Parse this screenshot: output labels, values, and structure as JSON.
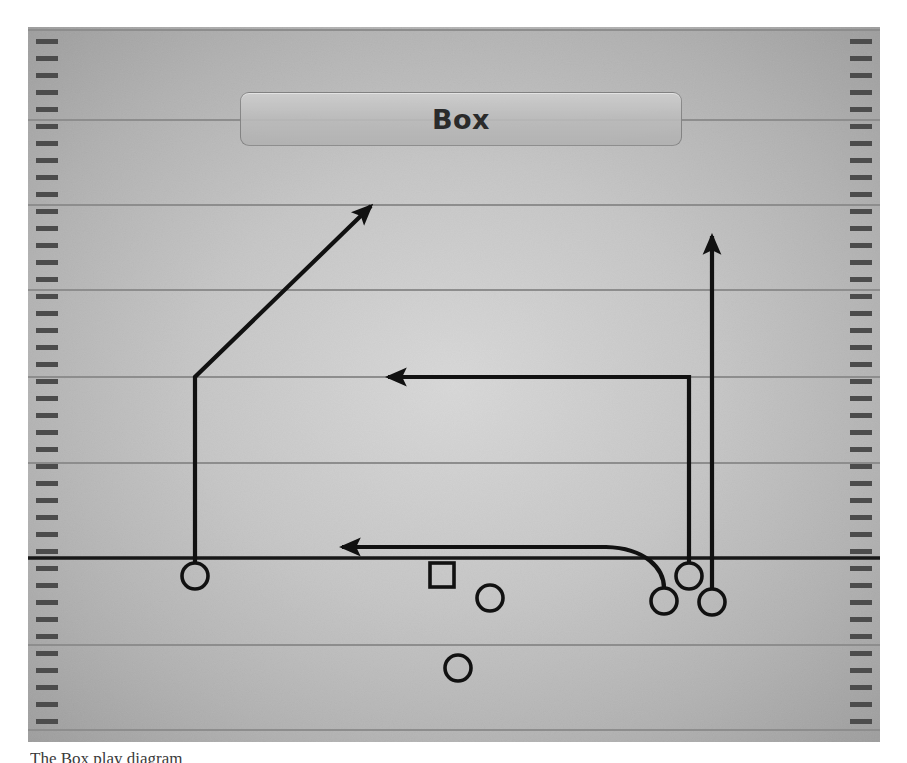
{
  "diagram": {
    "title": "Box",
    "caption": "The Box play diagram",
    "field": {
      "surface_color": "#b4b4b4",
      "line_color": "#8f8f8f",
      "hash_color": "#4a4a4a",
      "los_color": "#1a1a1a",
      "route_color": "#111111",
      "yard_lines_y": [
        3,
        93,
        178,
        263,
        350,
        436,
        531,
        618,
        703
      ],
      "line_of_scrimmage_y": 531,
      "hash_tick_spacing": 17,
      "hash_tick_width": 22,
      "hash_tick_height": 5
    },
    "box_label": {
      "text": "Box",
      "x": 212,
      "y": 65,
      "width": 442,
      "height": 54
    },
    "players": [
      {
        "id": "X",
        "shape": "circle",
        "x": 167,
        "y": 549,
        "r": 13,
        "label": ""
      },
      {
        "id": "C",
        "shape": "square",
        "x": 414,
        "y": 548,
        "size": 24,
        "label": ""
      },
      {
        "id": "QB",
        "shape": "circle",
        "x": 462,
        "y": 571,
        "r": 13,
        "label": ""
      },
      {
        "id": "RB",
        "shape": "circle",
        "x": 430,
        "y": 641,
        "r": 13,
        "label": ""
      },
      {
        "id": "H",
        "shape": "circle",
        "x": 636,
        "y": 574,
        "r": 13,
        "label": ""
      },
      {
        "id": "Y",
        "shape": "circle",
        "x": 661,
        "y": 549,
        "r": 13,
        "label": ""
      },
      {
        "id": "Z",
        "shape": "circle",
        "x": 684,
        "y": 575,
        "r": 13,
        "label": ""
      }
    ],
    "routes": [
      {
        "name": "corner-route",
        "player": "X",
        "path": "M 167 536 L 167 350 L 340 176",
        "arrow": {
          "x": 340,
          "y": 176,
          "angle": -45
        }
      },
      {
        "name": "dig-route",
        "player": "Y",
        "path": "M 661 536 L 661 350 L 358 350",
        "arrow": {
          "x": 350,
          "y": 350,
          "angle": 180
        }
      },
      {
        "name": "drag-route",
        "player": "H",
        "path": "M 636 561 C 636 540, 620 521, 580 520 L 312 520",
        "arrow": {
          "x": 304,
          "y": 520,
          "angle": 180
        }
      },
      {
        "name": "go-route",
        "player": "Z",
        "path": "M 684 562 L 684 206",
        "arrow": {
          "x": 684,
          "y": 198,
          "angle": -90
        }
      }
    ]
  }
}
